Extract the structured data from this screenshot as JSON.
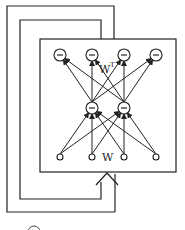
{
  "diagram": {
    "type": "neural-network-feedback",
    "layers": {
      "output": {
        "count": 4,
        "node_symbol": "minus",
        "node_style": "hollow"
      },
      "hidden": {
        "count": 2,
        "node_symbol": "minus",
        "node_style": "hollow"
      },
      "input": {
        "count": 4,
        "node_symbol": "none",
        "node_style": "small-hollow"
      }
    },
    "labels": {
      "encoder_weights": "W",
      "decoder_weights": "W",
      "decoder_weights_sup": "T"
    },
    "connections": "fully-connected between adjacent layers",
    "feedback_loops": 2,
    "colors": {
      "stroke": "#222222",
      "background": "#ffffff"
    }
  }
}
